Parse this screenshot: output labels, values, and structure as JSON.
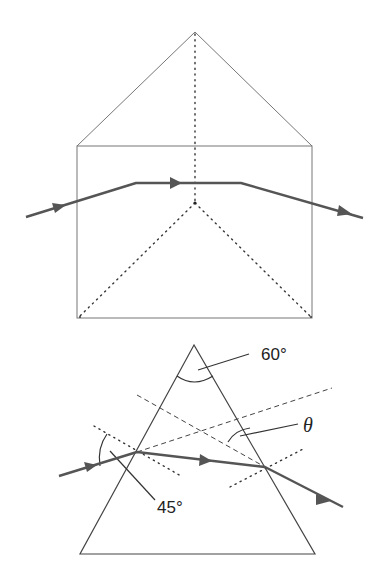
{
  "figures": [
    {
      "name": "prism-3d-view",
      "description": "Triangular prism viewed in perspective with ray passing through"
    },
    {
      "name": "prism-cross-section",
      "description": "Equilateral prism cross-section showing refraction",
      "labels": {
        "apex_angle": "60°",
        "incidence_angle": "45°",
        "deviation_angle": "θ"
      }
    }
  ],
  "colors": {
    "outline": "#777777",
    "ray": "#555555",
    "text": "#222222"
  }
}
